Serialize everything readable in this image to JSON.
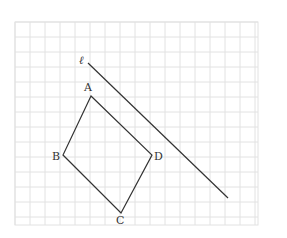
{
  "figure": {
    "grid": {
      "x0": 15,
      "y0": 22,
      "cols": 16,
      "rows": 13.5,
      "cell": 15,
      "right": 258,
      "bottom": 225,
      "line_color": "#e2e2e2"
    },
    "line_l": {
      "label": "ℓ",
      "x1": 88,
      "y1": 63,
      "x2": 228,
      "y2": 198,
      "color": "#333333"
    },
    "quadrilateral": {
      "color": "#333333",
      "vertices": [
        {
          "name": "A",
          "x": 91,
          "y": 96,
          "lx": 84,
          "ly": 91
        },
        {
          "name": "D",
          "x": 152,
          "y": 155,
          "lx": 154,
          "ly": 160
        },
        {
          "name": "C",
          "x": 121,
          "y": 213,
          "lx": 116,
          "ly": 224
        },
        {
          "name": "B",
          "x": 63,
          "y": 155,
          "lx": 52,
          "ly": 160
        }
      ]
    }
  }
}
